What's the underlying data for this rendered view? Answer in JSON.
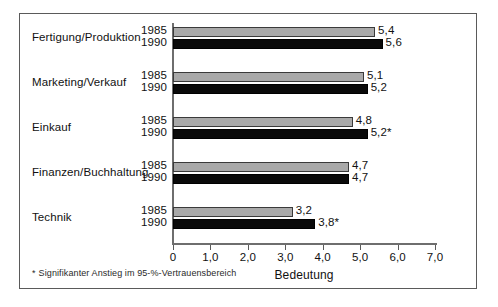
{
  "chart_data": {
    "type": "bar",
    "orientation": "horizontal",
    "title": "",
    "xlabel": "Bedeutung",
    "ylabel": "",
    "xlim": [
      0,
      7
    ],
    "xticks": [
      "0",
      "1,0",
      "2,0",
      "3,0",
      "4,0",
      "5,0",
      "6,0",
      "7,0"
    ],
    "xtick_values": [
      0,
      1,
      2,
      3,
      4,
      5,
      6,
      7
    ],
    "grid": false,
    "legend": "none",
    "series": [
      {
        "name": "1985",
        "color": "#a9a9a9",
        "values": [
          5.4,
          5.1,
          4.8,
          4.7,
          3.2
        ]
      },
      {
        "name": "1990",
        "color": "#0a0a0a",
        "values": [
          5.6,
          5.2,
          5.2,
          4.7,
          3.8
        ]
      }
    ],
    "categories": [
      "Fertigung/Produktion",
      "Marketing/Verkauf",
      "Einkauf",
      "Finanzen/Buchhaltung",
      "Technik"
    ],
    "groups": [
      {
        "category": "Fertigung/Produktion",
        "bars": [
          {
            "year": "1985",
            "value": 5.4,
            "label": "5,4",
            "significant": false
          },
          {
            "year": "1990",
            "value": 5.6,
            "label": "5,6",
            "significant": false
          }
        ]
      },
      {
        "category": "Marketing/Verkauf",
        "bars": [
          {
            "year": "1985",
            "value": 5.1,
            "label": "5,1",
            "significant": false
          },
          {
            "year": "1990",
            "value": 5.2,
            "label": "5,2",
            "significant": false
          }
        ]
      },
      {
        "category": "Einkauf",
        "bars": [
          {
            "year": "1985",
            "value": 4.8,
            "label": "4,8",
            "significant": false
          },
          {
            "year": "1990",
            "value": 5.2,
            "label": "5,2*",
            "significant": true
          }
        ]
      },
      {
        "category": "Finanzen/Buchhaltung",
        "bars": [
          {
            "year": "1985",
            "value": 4.7,
            "label": "4,7",
            "significant": false
          },
          {
            "year": "1990",
            "value": 4.7,
            "label": "4,7",
            "significant": false
          }
        ]
      },
      {
        "category": "Technik",
        "bars": [
          {
            "year": "1985",
            "value": 3.2,
            "label": "3,2",
            "significant": false
          },
          {
            "year": "1990",
            "value": 3.8,
            "label": "3,8*",
            "significant": true
          }
        ]
      }
    ],
    "annotations": [
      {
        "name": "footnote",
        "marker": "*",
        "text": "Signifikanter Anstieg im 95-%-Vertrauensbereich"
      }
    ]
  },
  "footnote": {
    "marker": "*",
    "text": "Signifikanter Anstieg im 95-%-Vertrauensbereich"
  },
  "axis": {
    "x_title": "Bedeutung"
  }
}
